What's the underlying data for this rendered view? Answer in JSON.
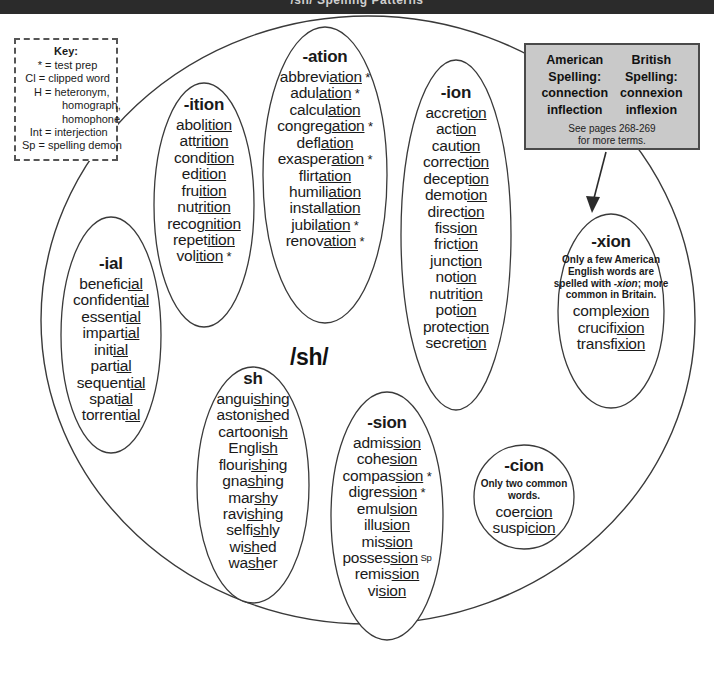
{
  "topbar": {
    "text": "/sh/ Spelling Patterns"
  },
  "phoneme": {
    "label": "/sh/"
  },
  "key": {
    "title": "Key:",
    "rows": [
      {
        "sym": "*",
        "desc": "= test prep"
      },
      {
        "sym": "Cl",
        "desc": "= clipped word"
      },
      {
        "sym": "H",
        "desc": "= heteronym,"
      }
    ],
    "cont": [
      "homograph,",
      "homophone"
    ],
    "rows2": [
      {
        "sym": "Int",
        "desc": "= interjection"
      },
      {
        "sym": "Sp",
        "desc": "= spelling demon"
      }
    ]
  },
  "spelling_box": {
    "american_title_1": "American",
    "american_title_2": "Spelling:",
    "american_words": [
      "connection",
      "inflection"
    ],
    "british_title_1": "British",
    "british_title_2": "Spelling:",
    "british_words": [
      "connexion",
      "inflexion"
    ],
    "see_line_1": "See pages 268-269",
    "see_line_2": "for more terms."
  },
  "groups": {
    "ition": {
      "header": "-ition",
      "words": [
        {
          "pre": "abol",
          "un": "ition",
          "post": "",
          "mark": ""
        },
        {
          "pre": "att",
          "un": "rition",
          "post": "",
          "mark": ""
        },
        {
          "pre": "cond",
          "un": "ition",
          "post": "",
          "mark": ""
        },
        {
          "pre": "ed",
          "un": "ition",
          "post": "",
          "mark": ""
        },
        {
          "pre": "fru",
          "un": "ition",
          "post": "",
          "mark": ""
        },
        {
          "pre": "nut",
          "un": "rition",
          "post": "",
          "mark": ""
        },
        {
          "pre": "recog",
          "un": "nition",
          "post": "",
          "mark": ""
        },
        {
          "pre": "repet",
          "un": "ition",
          "post": "",
          "mark": ""
        },
        {
          "pre": "vol",
          "un": "ition",
          "post": "",
          "mark": "*"
        }
      ]
    },
    "ation": {
      "header": "-ation",
      "words": [
        {
          "pre": "abbrevi",
          "un": "ation",
          "post": "",
          "mark": "*"
        },
        {
          "pre": "adul",
          "un": "ation",
          "post": "",
          "mark": "*"
        },
        {
          "pre": "calcul",
          "un": "ation",
          "post": "",
          "mark": ""
        },
        {
          "pre": "congreg",
          "un": "ation",
          "post": "",
          "mark": "*"
        },
        {
          "pre": "defl",
          "un": "ation",
          "post": "",
          "mark": ""
        },
        {
          "pre": "exasper",
          "un": "ation",
          "post": "",
          "mark": "*"
        },
        {
          "pre": "flirt",
          "un": "ation",
          "post": "",
          "mark": ""
        },
        {
          "pre": "humili",
          "un": "ation",
          "post": "",
          "mark": ""
        },
        {
          "pre": "install",
          "un": "ation",
          "post": "",
          "mark": ""
        },
        {
          "pre": "jubil",
          "un": "ation",
          "post": "",
          "mark": "*"
        },
        {
          "pre": "renov",
          "un": "ation",
          "post": "",
          "mark": "*"
        }
      ]
    },
    "ion": {
      "header": "-ion",
      "words": [
        {
          "pre": "accret",
          "un": "ion",
          "post": "",
          "mark": ""
        },
        {
          "pre": "act",
          "un": "ion",
          "post": "",
          "mark": ""
        },
        {
          "pre": "caut",
          "un": "ion",
          "post": "",
          "mark": ""
        },
        {
          "pre": "correct",
          "un": "ion",
          "post": "",
          "mark": ""
        },
        {
          "pre": "decept",
          "un": "ion",
          "post": "",
          "mark": ""
        },
        {
          "pre": "demot",
          "un": "ion",
          "post": "",
          "mark": ""
        },
        {
          "pre": "direct",
          "un": "ion",
          "post": "",
          "mark": ""
        },
        {
          "pre": "fiss",
          "un": "ion",
          "post": "",
          "mark": ""
        },
        {
          "pre": "frict",
          "un": "ion",
          "post": "",
          "mark": ""
        },
        {
          "pre": "junct",
          "un": "ion",
          "post": "",
          "mark": ""
        },
        {
          "pre": "not",
          "un": "ion",
          "post": "",
          "mark": ""
        },
        {
          "pre": "nutrit",
          "un": "ion",
          "post": "",
          "mark": ""
        },
        {
          "pre": "pot",
          "un": "ion",
          "post": "",
          "mark": ""
        },
        {
          "pre": "protect",
          "un": "ion",
          "post": "",
          "mark": ""
        },
        {
          "pre": "secret",
          "un": "ion",
          "post": "",
          "mark": ""
        }
      ]
    },
    "xion": {
      "header": "-xion",
      "note": "Only a few American English words are spelled with -xion; more common in Britain.",
      "note_italic": "-xion",
      "words": [
        {
          "pre": "comple",
          "un": "xion",
          "post": "",
          "mark": ""
        },
        {
          "pre": "crucifi",
          "un": "xion",
          "post": "",
          "mark": ""
        },
        {
          "pre": "transfi",
          "un": "xion",
          "post": "",
          "mark": ""
        }
      ]
    },
    "ial": {
      "header": "-ial",
      "words": [
        {
          "pre": "benefic",
          "un": "ial",
          "post": "",
          "mark": ""
        },
        {
          "pre": "confident",
          "un": "ial",
          "post": "",
          "mark": ""
        },
        {
          "pre": "essent",
          "un": "ial",
          "post": "",
          "mark": ""
        },
        {
          "pre": "impart",
          "un": "ial",
          "post": "",
          "mark": ""
        },
        {
          "pre": "init",
          "un": "ial",
          "post": "",
          "mark": ""
        },
        {
          "pre": "part",
          "un": "ial",
          "post": "",
          "mark": ""
        },
        {
          "pre": "sequent",
          "un": "ial",
          "post": "",
          "mark": ""
        },
        {
          "pre": "spat",
          "un": "ial",
          "post": "",
          "mark": ""
        },
        {
          "pre": "torrent",
          "un": "ial",
          "post": "",
          "mark": ""
        }
      ]
    },
    "sh": {
      "header": "sh",
      "words": [
        {
          "pre": "angui",
          "un": "sh",
          "post": "ing",
          "mark": ""
        },
        {
          "pre": "astoni",
          "un": "sh",
          "post": "ed",
          "mark": ""
        },
        {
          "pre": "cartooni",
          "un": "sh",
          "post": "",
          "mark": ""
        },
        {
          "pre": "Engli",
          "un": "sh",
          "post": "",
          "mark": ""
        },
        {
          "pre": "flouri",
          "un": "sh",
          "post": "ing",
          "mark": ""
        },
        {
          "pre": "gna",
          "un": "sh",
          "post": "ing",
          "mark": ""
        },
        {
          "pre": "mar",
          "un": "sh",
          "post": "y",
          "mark": ""
        },
        {
          "pre": "ravi",
          "un": "sh",
          "post": "ing",
          "mark": ""
        },
        {
          "pre": "selfi",
          "un": "sh",
          "post": "ly",
          "mark": ""
        },
        {
          "pre": "wi",
          "un": "sh",
          "post": "ed",
          "mark": ""
        },
        {
          "pre": "wa",
          "un": "sh",
          "post": "er",
          "mark": ""
        }
      ]
    },
    "sion": {
      "header": "-sion",
      "words": [
        {
          "pre": "admis",
          "un": "sion",
          "post": "",
          "mark": ""
        },
        {
          "pre": "cohe",
          "un": "sion",
          "post": "",
          "mark": ""
        },
        {
          "pre": "compas",
          "un": "sion",
          "post": "",
          "mark": "*"
        },
        {
          "pre": "digres",
          "un": "sion",
          "post": "",
          "mark": "*"
        },
        {
          "pre": "emul",
          "un": "sion",
          "post": "",
          "mark": ""
        },
        {
          "pre": "illu",
          "un": "sion",
          "post": "",
          "mark": ""
        },
        {
          "pre": "mis",
          "un": "sion",
          "post": "",
          "mark": ""
        },
        {
          "pre": "posses",
          "un": "sion",
          "post": "",
          "mark": "Sp"
        },
        {
          "pre": "remis",
          "un": "sion",
          "post": "",
          "mark": ""
        },
        {
          "pre": "vi",
          "un": "sion",
          "post": "",
          "mark": ""
        }
      ]
    },
    "cion": {
      "header": "-cion",
      "note": "Only two common words.",
      "words": [
        {
          "pre": "coer",
          "un": "cion",
          "post": "",
          "mark": ""
        },
        {
          "pre": "suspi",
          "un": "cion",
          "post": "",
          "mark": ""
        }
      ]
    }
  }
}
